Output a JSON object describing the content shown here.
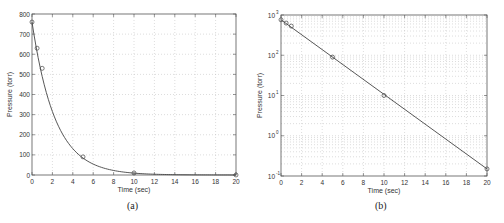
{
  "chart_data": [
    {
      "type": "line",
      "panel_label": "(a)",
      "title": "",
      "xlabel": "Time (sec)",
      "ylabel": "Pressure (torr)",
      "xlim": [
        0,
        20
      ],
      "ylim": [
        0,
        800
      ],
      "yscale": "linear",
      "grid": true,
      "x_ticks": [
        "0",
        "2",
        "4",
        "6",
        "8",
        "10",
        "12",
        "14",
        "16",
        "18",
        "20"
      ],
      "y_ticks": [
        "0",
        "100",
        "200",
        "300",
        "400",
        "500",
        "600",
        "700",
        "800"
      ],
      "series": [
        {
          "name": "measured",
          "style": "markers-circle",
          "x": [
            0,
            0.5,
            1,
            5,
            10,
            20
          ],
          "y": [
            760,
            630,
            530,
            90,
            10,
            0.15
          ]
        },
        {
          "name": "fit",
          "style": "line",
          "model": "P = 760*exp(-0.44 t)",
          "x": [
            0,
            1,
            2,
            3,
            4,
            5,
            6,
            7,
            8,
            9,
            10,
            12,
            14,
            16,
            18,
            20
          ],
          "y": [
            760,
            490,
            315,
            203,
            131,
            84,
            54,
            35,
            23,
            15,
            9.4,
            3.9,
            1.6,
            0.67,
            0.28,
            0.15
          ]
        }
      ]
    },
    {
      "type": "line",
      "panel_label": "(b)",
      "title": "",
      "xlabel": "Time (sec)",
      "ylabel": "Pressure (torr)",
      "xlim": [
        0,
        20
      ],
      "ylim": [
        0.1,
        1000
      ],
      "yscale": "log",
      "grid": true,
      "x_ticks": [
        "0",
        "2",
        "4",
        "6",
        "8",
        "10",
        "12",
        "14",
        "16",
        "18",
        "20"
      ],
      "y_ticks": [
        "10^-1",
        "10^0",
        "10^1",
        "10^2",
        "10^3"
      ],
      "series": [
        {
          "name": "measured",
          "style": "markers-circle",
          "x": [
            0,
            0.5,
            1,
            5,
            10,
            20
          ],
          "y": [
            760,
            630,
            530,
            90,
            10,
            0.15
          ]
        },
        {
          "name": "fit",
          "style": "line",
          "x": [
            0,
            20
          ],
          "y": [
            760,
            0.15
          ]
        }
      ]
    }
  ],
  "captions": {
    "a": "(a)",
    "b": "(b)"
  },
  "axes": {
    "a": {
      "xlabel": "Time (sec)",
      "ylabel": "Pressure (torr)"
    },
    "b": {
      "xlabel": "Time (sec)",
      "ylabel": "Pressure (torr)"
    }
  }
}
